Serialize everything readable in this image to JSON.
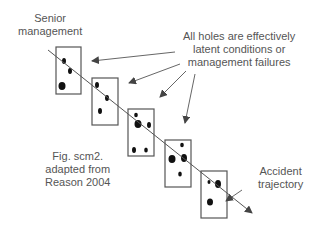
{
  "labels": {
    "senior": [
      "Senior",
      "management"
    ],
    "holes": [
      "All holes are effectively",
      "latent conditions or",
      "management failures"
    ],
    "fig": [
      "Fig. scm2.",
      "adapted from",
      "Reason 2004"
    ],
    "accident": [
      "Accident",
      "trajectory"
    ]
  },
  "colors": {
    "stroke": "#555555",
    "hole": "#111111",
    "text": "#555555"
  }
}
